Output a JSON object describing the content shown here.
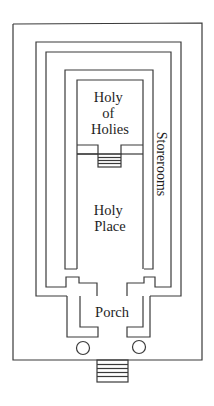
{
  "diagram": {
    "type": "floor-plan",
    "labels": {
      "holy_of_holies": [
        "Holy",
        "of",
        "Holies"
      ],
      "holy_place": [
        "Holy",
        "Place"
      ],
      "porch": "Porch",
      "storerooms": "Storerooms"
    },
    "colors": {
      "line": "#3a3a3a",
      "text": "#1e1e1e",
      "background": "#ffffff"
    },
    "elements": {
      "pillars_count": 2,
      "stairs": [
        "inner-stairs",
        "entrance-stairs"
      ]
    }
  }
}
